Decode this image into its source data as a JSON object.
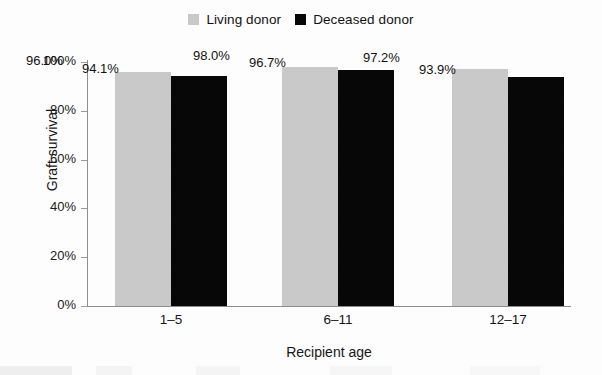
{
  "chart_data": {
    "type": "bar",
    "title": "",
    "subtitle": "",
    "xlabel": "Recipient age",
    "ylabel": "Graft survival",
    "categories": [
      "1–5",
      "6–11",
      "12–17"
    ],
    "series": [
      {
        "name": "Living donor",
        "color": "#c9c9c9",
        "values": [
          96.0,
          98.0,
          97.2
        ],
        "labels": [
          "96.0%",
          "98.0%",
          "97.2%"
        ]
      },
      {
        "name": "Deceased donor",
        "color": "#070707",
        "values": [
          94.1,
          96.7,
          93.9
        ],
        "labels": [
          "94.1%",
          "96.7%",
          "93.9%"
        ]
      }
    ],
    "ylim": [
      0,
      100
    ],
    "yticks": [
      0,
      20,
      40,
      60,
      80,
      100
    ],
    "ytick_labels": [
      "0%",
      "20%",
      "40%",
      "60%",
      "80%",
      "100%"
    ],
    "grid": false,
    "legend_position": "top-center",
    "value_unit": "%",
    "bar_value_labels_shown": true
  },
  "legend": {
    "items": [
      {
        "label": "Living donor",
        "swatch_name": "legend-swatch-living-donor"
      },
      {
        "label": "Deceased donor",
        "swatch_name": "legend-swatch-deceased-donor"
      }
    ]
  },
  "axes": {
    "y_title": "Graft survival",
    "x_title": "Recipient age"
  }
}
